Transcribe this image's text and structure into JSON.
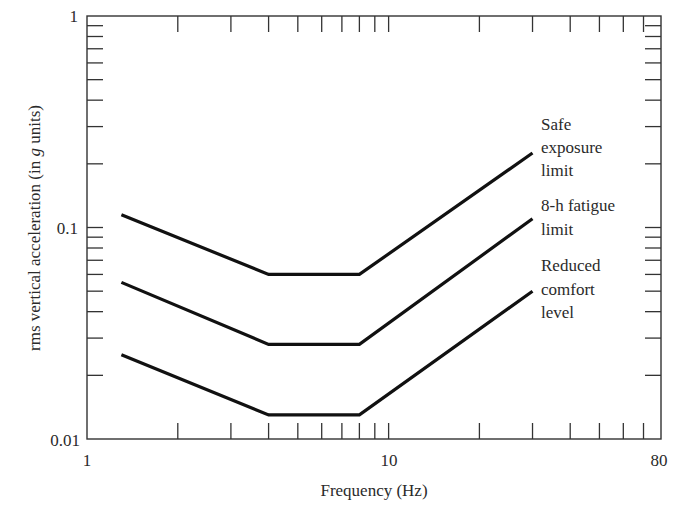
{
  "chart_data": {
    "type": "line",
    "title": "",
    "xlabel": "Frequency (Hz)",
    "ylabel_parts": [
      "rms vertical acceleration (in ",
      "g",
      " units)"
    ],
    "ylabel": "rms vertical acceleration (in g units)",
    "x_scale": "log",
    "y_scale": "log",
    "xlim": [
      1,
      80
    ],
    "ylim": [
      0.01,
      1
    ],
    "x_tick_labels": [
      {
        "value": 1,
        "label": "1"
      },
      {
        "value": 10,
        "label": "10"
      },
      {
        "value": 80,
        "label": "80"
      }
    ],
    "y_tick_labels": [
      {
        "value": 0.01,
        "label": "0.01"
      },
      {
        "value": 0.1,
        "label": "0.1"
      },
      {
        "value": 1,
        "label": "1"
      }
    ],
    "x_minor_ticks": [
      2,
      3,
      4,
      5,
      6,
      7,
      8,
      9,
      20,
      30,
      40,
      50,
      60,
      70
    ],
    "y_minor_ticks": [
      0.02,
      0.03,
      0.04,
      0.05,
      0.06,
      0.07,
      0.08,
      0.09,
      0.2,
      0.3,
      0.4,
      0.5,
      0.6,
      0.7,
      0.8,
      0.9
    ],
    "grid": false,
    "legend": "inline labels at right end of each line",
    "series": [
      {
        "name": "Safe exposure limit",
        "label_lines": [
          "Safe",
          "exposure",
          "limit"
        ],
        "x": [
          1.3,
          4,
          8,
          30
        ],
        "y": [
          0.115,
          0.06,
          0.06,
          0.225
        ]
      },
      {
        "name": "8-h fatigue limit",
        "label_lines": [
          "8-h fatigue",
          "limit"
        ],
        "x": [
          1.3,
          4,
          8,
          30
        ],
        "y": [
          0.055,
          0.028,
          0.028,
          0.11
        ]
      },
      {
        "name": "Reduced comfort level",
        "label_lines": [
          "Reduced",
          "comfort",
          "level"
        ],
        "x": [
          1.3,
          4,
          8,
          30
        ],
        "y": [
          0.025,
          0.013,
          0.013,
          0.05
        ]
      }
    ]
  }
}
